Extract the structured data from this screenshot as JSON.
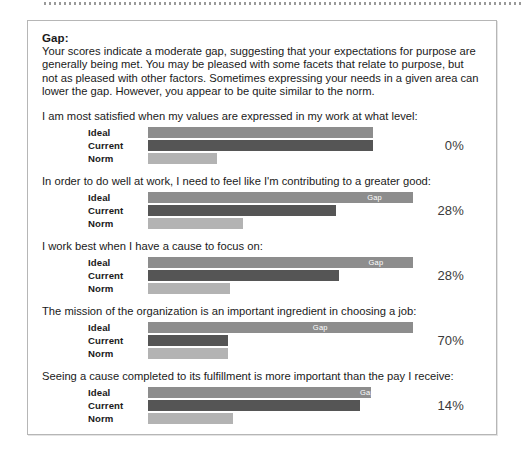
{
  "document": {
    "section_heading": "Gap:",
    "section_paragraph": "Your scores indicate a moderate gap, suggesting that your expectations for purpose are generally being met.  You may be pleased with some facets that relate to purpose, but not as pleased with other factors. Sometimes expressing your needs in a given area can lower the gap. However, you appear to be quite similar to the norm.",
    "gap_tag_label": "Gap",
    "series_labels": {
      "ideal": "Ideal",
      "current": "Current",
      "norm": "Norm"
    },
    "colors": {
      "ideal": "#8d8d8d",
      "current": "#555555",
      "norm": "#b3b3b3",
      "card_border": "#b6b6b6",
      "page_background": "#ffffff"
    }
  },
  "chart_data": {
    "type": "bar",
    "title": "Gap",
    "orientation": "horizontal",
    "series_names": [
      "Ideal",
      "Current",
      "Norm"
    ],
    "xlabel": "",
    "ylabel": "",
    "xlim": [
      0,
      100
    ],
    "grid": false,
    "legend": "none",
    "annotation": "Gap segment on the Ideal bar marks the difference between Ideal and Current",
    "groups": [
      {
        "question": "I am most satisfied when my values are expressed in my work at what level:",
        "gap_percent": "0%",
        "gap_value": 0,
        "show_gap_tag": false,
        "values": {
          "ideal": 85,
          "current": 85,
          "norm": 26
        }
      },
      {
        "question": "In order to do well at work, I need to feel like I'm contributing to a greater good:",
        "gap_percent": "28%",
        "gap_value": 28,
        "show_gap_tag": true,
        "values": {
          "ideal": 100,
          "current": 71,
          "norm": 36
        }
      },
      {
        "question": "I work best when I have a cause to focus on:",
        "gap_percent": "28%",
        "gap_value": 28,
        "show_gap_tag": true,
        "values": {
          "ideal": 100,
          "current": 72,
          "norm": 31
        }
      },
      {
        "question": "The mission of the organization is an important ingredient in choosing a job:",
        "gap_percent": "70%",
        "gap_value": 70,
        "show_gap_tag": true,
        "values": {
          "ideal": 100,
          "current": 30,
          "norm": 30
        }
      },
      {
        "question": "Seeing a cause completed to its fulfillment is more important than the pay I receive:",
        "gap_percent": "14%",
        "gap_value": 14,
        "show_gap_tag": true,
        "values": {
          "ideal": 84,
          "current": 80,
          "norm": 32
        }
      }
    ]
  }
}
